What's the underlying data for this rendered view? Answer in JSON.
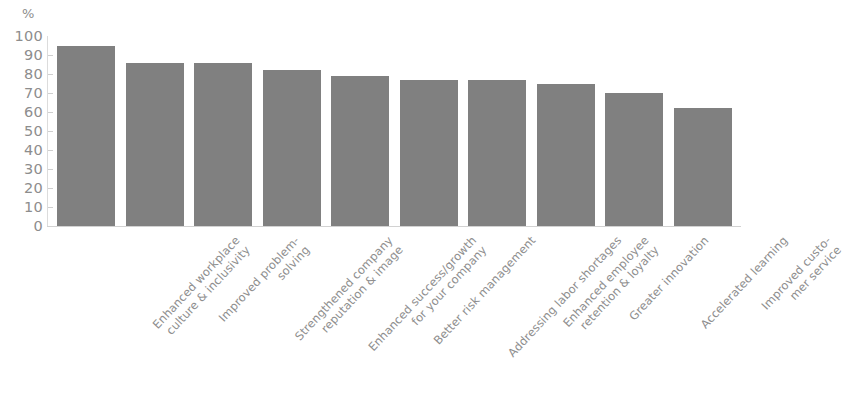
{
  "chart_data": {
    "type": "bar",
    "title": "",
    "xlabel": "",
    "ylabel": "%",
    "ylim": [
      0,
      100
    ],
    "grid": false,
    "legend": "none",
    "orientation": "vertical",
    "bar_color": "#808080",
    "axis_text_color": "#8e8e8e",
    "y_ticks": [
      "100",
      "90",
      "80",
      "70",
      "60",
      "50",
      "40",
      "30",
      "20",
      "10",
      "0"
    ],
    "y_tick_values": [
      100,
      90,
      80,
      70,
      60,
      50,
      40,
      30,
      20,
      10,
      0
    ],
    "categories": [
      "Enhanced workplace culture & inclusivity",
      "Improved problem-solving",
      "Strengthened company reputation & image",
      "Enhanced success/growth for your company",
      "Better risk management",
      "Addressing labor shortages",
      "Enhanced employee retention & loyalty",
      "Greater innovation",
      "Accelerated learning",
      "Improved customer service"
    ],
    "category_lines": [
      [
        "Enhanced workplace",
        "culture & inclusivity"
      ],
      [
        "Improved problem-",
        "solving"
      ],
      [
        "Strengthened company",
        "reputation & image"
      ],
      [
        "Enhanced success/growth",
        "for your company"
      ],
      [
        "Better risk management",
        ""
      ],
      [
        "Addressing labor shortages",
        ""
      ],
      [
        "Enhanced employee",
        "retention & loyalty"
      ],
      [
        "Greater innovation",
        ""
      ],
      [
        "Accelerated learning",
        ""
      ],
      [
        "Improved custo-",
        "mer service"
      ]
    ],
    "values": [
      95,
      86,
      86,
      82,
      79,
      77,
      77,
      75,
      70,
      62
    ]
  }
}
